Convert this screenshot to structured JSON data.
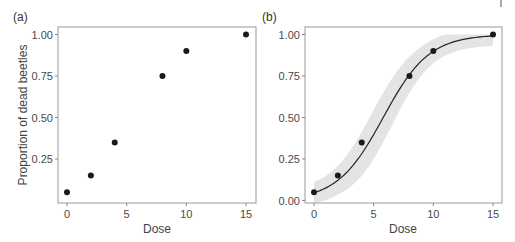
{
  "chart_data": [
    {
      "type": "scatter",
      "panel_label": "(a)",
      "title": "",
      "xlabel": "Dose",
      "ylabel": "Proportion of dead beetles",
      "x": [
        0,
        2,
        4,
        8,
        10,
        15
      ],
      "values": [
        0.05,
        0.15,
        0.35,
        0.75,
        0.9,
        1.0
      ],
      "xticks": [
        "0",
        "5",
        "10",
        "15"
      ],
      "yticks": [
        "0.25",
        "0.50",
        "0.75",
        "1.00"
      ],
      "xlim": [
        -0.5,
        15.5
      ],
      "ylim": [
        0.0,
        1.03
      ],
      "grid": false,
      "legend": null
    },
    {
      "type": "scatter",
      "panel_label": "(b)",
      "title": "",
      "xlabel": "Dose",
      "ylabel": "",
      "x": [
        0,
        2,
        4,
        8,
        10,
        15
      ],
      "values": [
        0.05,
        0.15,
        0.35,
        0.75,
        0.9,
        1.0
      ],
      "fit": {
        "kind": "logistic",
        "description": "fitted logistic curve with grey confidence band",
        "midpoint_dose": 5.8,
        "slope": 0.52
      },
      "xticks": [
        "0",
        "5",
        "10",
        "15"
      ],
      "yticks": [
        "0.00",
        "0.25",
        "0.50",
        "0.75",
        "1.00"
      ],
      "xlim": [
        -0.5,
        15.5
      ],
      "ylim": [
        -0.02,
        1.03
      ],
      "grid": false,
      "legend": null
    }
  ],
  "panels": {
    "a": {
      "label": "(a)",
      "xlabel": "Dose",
      "ylabel": "Proportion of dead beetles"
    },
    "b": {
      "label": "(b)",
      "xlabel": "Dose"
    }
  },
  "colors": {
    "points": "#1a1a1a",
    "band": "#e4e4e4",
    "axis": "#8a8a8a",
    "curve": "#222222"
  }
}
